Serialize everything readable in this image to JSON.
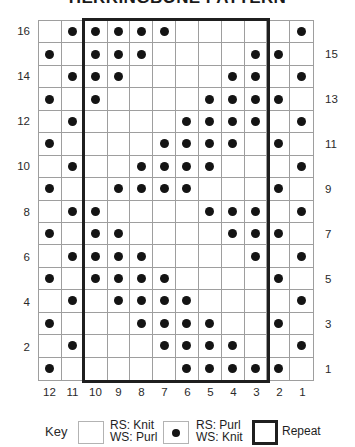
{
  "title": "HERRINGBONE PATTERN",
  "chart_data": {
    "type": "knitting-chart",
    "title": "HERRINGBONE PATTERN",
    "columns_left_to_right": [
      12,
      11,
      10,
      9,
      8,
      7,
      6,
      5,
      4,
      3,
      2,
      1
    ],
    "rows_top_to_bottom": [
      {
        "row": 16,
        "label_side": "left",
        "purl_columns": [
          11,
          10,
          9,
          8,
          7,
          1
        ]
      },
      {
        "row": 15,
        "label_side": "right",
        "purl_columns": [
          12,
          10,
          9,
          8,
          3,
          2
        ]
      },
      {
        "row": 14,
        "label_side": "left",
        "purl_columns": [
          11,
          10,
          9,
          4,
          3,
          1
        ]
      },
      {
        "row": 13,
        "label_side": "right",
        "purl_columns": [
          12,
          10,
          5,
          4,
          3,
          2
        ]
      },
      {
        "row": 12,
        "label_side": "left",
        "purl_columns": [
          11,
          6,
          5,
          4,
          3,
          1
        ]
      },
      {
        "row": 11,
        "label_side": "right",
        "purl_columns": [
          12,
          7,
          6,
          5,
          4,
          2
        ]
      },
      {
        "row": 10,
        "label_side": "left",
        "purl_columns": [
          11,
          8,
          7,
          6,
          5,
          1
        ]
      },
      {
        "row": 9,
        "label_side": "right",
        "purl_columns": [
          12,
          9,
          8,
          7,
          6,
          2
        ]
      },
      {
        "row": 8,
        "label_side": "left",
        "purl_columns": [
          11,
          10,
          5,
          4,
          3,
          1
        ]
      },
      {
        "row": 7,
        "label_side": "right",
        "purl_columns": [
          12,
          10,
          9,
          4,
          3,
          2
        ]
      },
      {
        "row": 6,
        "label_side": "left",
        "purl_columns": [
          11,
          10,
          9,
          8,
          3,
          1
        ]
      },
      {
        "row": 5,
        "label_side": "right",
        "purl_columns": [
          12,
          10,
          9,
          8,
          7,
          2
        ]
      },
      {
        "row": 4,
        "label_side": "left",
        "purl_columns": [
          11,
          9,
          8,
          7,
          6,
          1
        ]
      },
      {
        "row": 3,
        "label_side": "right",
        "purl_columns": [
          12,
          8,
          7,
          6,
          5,
          2
        ]
      },
      {
        "row": 2,
        "label_side": "left",
        "purl_columns": [
          11,
          7,
          6,
          5,
          4,
          1
        ]
      },
      {
        "row": 1,
        "label_side": "right",
        "purl_columns": [
          12,
          6,
          5,
          4,
          3,
          2
        ]
      }
    ],
    "repeat_span": {
      "from_column": 10,
      "to_column": 3
    }
  },
  "key": {
    "label": "Key",
    "items": [
      {
        "symbol": "blank-square",
        "line1": "RS: Knit",
        "line2": "WS: Purl"
      },
      {
        "symbol": "dot-square",
        "line1": "RS: Purl",
        "line2": "WS: Knit"
      },
      {
        "symbol": "repeat-outline-square",
        "line1": "Repeat",
        "line2": ""
      }
    ]
  },
  "colors": {
    "background": "#ffffff",
    "grid_line": "#9e9e9e",
    "symbol_dot": "#141414",
    "repeat_border": "#1f1f1f",
    "text": "#2a2a2a"
  }
}
